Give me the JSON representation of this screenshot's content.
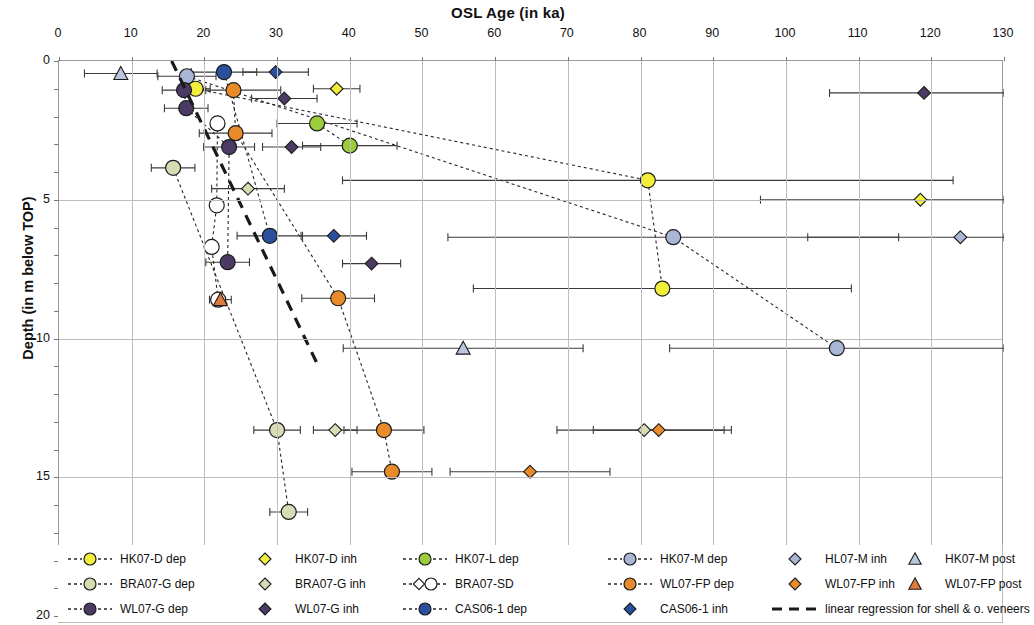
{
  "chart_data": {
    "type": "scatter",
    "title": "OSL Age (in ka)",
    "xlabel": "OSL Age (in ka)",
    "ylabel": "Depth  (in m below TOP)",
    "xlim": [
      0,
      130
    ],
    "ylim": [
      0,
      20
    ],
    "x_axis_position": "top",
    "y_axis_inverted": true,
    "xticks": [
      0,
      10,
      20,
      30,
      40,
      50,
      60,
      70,
      80,
      90,
      100,
      110,
      120,
      130
    ],
    "yticks": [
      0,
      5,
      10,
      15,
      20
    ],
    "y_minor_tick_step": 1,
    "grid": "vertical major + horizontal major",
    "legend_position": "bottom",
    "errorbars": "horizontal (1-sigma) on every point",
    "series": [
      {
        "name": "HK07-D dep",
        "marker": "circle",
        "color": "#f2ee3c",
        "connected": true,
        "points": [
          {
            "age": 18.8,
            "depth": 1.0,
            "err": 2.0
          },
          {
            "age": 81.0,
            "depth": 4.3,
            "err": 42.0
          },
          {
            "age": 83.0,
            "depth": 8.2,
            "err": 26.0
          }
        ]
      },
      {
        "name": "HK07-D inh",
        "marker": "diamond",
        "color": "#f2ee3c",
        "connected": false,
        "points": [
          {
            "age": 38.2,
            "depth": 1.0,
            "err": 3.2
          },
          {
            "age": 118.5,
            "depth": 5.0,
            "err": 22.0
          }
        ]
      },
      {
        "name": "HK07-L dep",
        "marker": "circle",
        "color": "#9ccc3c",
        "connected": true,
        "points": [
          {
            "age": 35.5,
            "depth": 2.25,
            "err": 5.5
          },
          {
            "age": 40.0,
            "depth": 3.05,
            "err": 6.5
          }
        ]
      },
      {
        "name": "HK07-M dep",
        "marker": "circle",
        "color": "#a9b6d6",
        "connected": true,
        "points": [
          {
            "age": 17.6,
            "depth": 0.55,
            "err": 4.0
          },
          {
            "age": 84.5,
            "depth": 6.35,
            "err": 31.0
          },
          {
            "age": 107.0,
            "depth": 10.35,
            "err": 23.0
          }
        ]
      },
      {
        "name": "HL07-M inh",
        "marker": "diamond",
        "color": "#a9b6d6",
        "connected": false,
        "points": [
          {
            "age": 124.0,
            "depth": 6.35,
            "err": 21.0
          }
        ]
      },
      {
        "name": "HK07-M post",
        "marker": "triangle",
        "color": "#b9c6de",
        "connected": false,
        "points": [
          {
            "age": 8.5,
            "depth": 0.45,
            "err": 5.0
          },
          {
            "age": 55.6,
            "depth": 10.35,
            "err": 16.5
          }
        ]
      },
      {
        "name": "BRA07-G dep",
        "marker": "circle",
        "color": "#d9dbb4",
        "connected": true,
        "points": [
          {
            "age": 15.7,
            "depth": 3.85,
            "err": 3.0
          },
          {
            "age": 30.0,
            "depth": 13.3,
            "err": 3.2
          },
          {
            "age": 31.6,
            "depth": 16.25,
            "err": 2.6
          }
        ]
      },
      {
        "name": "BRA07-G inh",
        "marker": "diamond",
        "color": "#d9dbb4",
        "connected": false,
        "points": [
          {
            "age": 26.0,
            "depth": 4.6,
            "err": 5.0
          },
          {
            "age": 38.0,
            "depth": 13.3,
            "err": 3.0
          },
          {
            "age": 80.5,
            "depth": 13.3,
            "err": 12.0
          }
        ]
      },
      {
        "name": "BRA07-SD",
        "marker": "open-circle",
        "color": "#ffffff",
        "connected": true,
        "points": [
          {
            "age": 21.8,
            "depth": 2.25,
            "err": 0
          },
          {
            "age": 21.7,
            "depth": 5.2,
            "err": 0
          },
          {
            "age": 21.0,
            "depth": 6.7,
            "err": 0
          },
          {
            "age": 21.9,
            "depth": 8.6,
            "err": 0
          }
        ]
      },
      {
        "name": "WL07-FP dep",
        "marker": "circle",
        "color": "#e98a2b",
        "connected": true,
        "points": [
          {
            "age": 24.0,
            "depth": 1.05,
            "err": 6.5
          },
          {
            "age": 24.3,
            "depth": 2.6,
            "err": 5.0
          },
          {
            "age": 38.4,
            "depth": 8.55,
            "err": 5.0
          },
          {
            "age": 44.7,
            "depth": 13.3,
            "err": 5.5
          },
          {
            "age": 45.8,
            "depth": 14.8,
            "err": 5.5
          }
        ]
      },
      {
        "name": "WL07-FP inh",
        "marker": "diamond",
        "color": "#e98a2b",
        "connected": false,
        "points": [
          {
            "age": 82.5,
            "depth": 13.3,
            "err": 9.0
          },
          {
            "age": 64.8,
            "depth": 14.8,
            "err": 11.0
          }
        ]
      },
      {
        "name": "WL07-FP post",
        "marker": "triangle",
        "color": "#dd7a3c",
        "connected": false,
        "points": [
          {
            "age": 22.2,
            "depth": 8.6,
            "err": 1.5
          }
        ]
      },
      {
        "name": "WL07-G dep",
        "marker": "circle",
        "color": "#4b3a63",
        "connected": true,
        "points": [
          {
            "age": 17.2,
            "depth": 1.05,
            "err": 3.0
          },
          {
            "age": 17.5,
            "depth": 1.7,
            "err": 3.0
          },
          {
            "age": 23.4,
            "depth": 3.1,
            "err": 3.5
          },
          {
            "age": 23.2,
            "depth": 7.25,
            "err": 3.0
          }
        ]
      },
      {
        "name": "WL07-G inh",
        "marker": "diamond",
        "color": "#4b3a63",
        "connected": false,
        "points": [
          {
            "age": 31.0,
            "depth": 1.35,
            "err": 4.5
          },
          {
            "age": 32.0,
            "depth": 3.1,
            "err": 4.0
          },
          {
            "age": 43.0,
            "depth": 7.3,
            "err": 4.0
          },
          {
            "age": 119.0,
            "depth": 1.15,
            "err": 13.0
          }
        ]
      },
      {
        "name": "CAS06-1 dep",
        "marker": "circle",
        "color": "#2b4f9e",
        "connected": true,
        "points": [
          {
            "age": 22.7,
            "depth": 0.4,
            "err": 4.5
          },
          {
            "age": 29.0,
            "depth": 6.3,
            "err": 4.5
          }
        ]
      },
      {
        "name": "CAS06-1 inh",
        "marker": "diamond",
        "color": "#2b4f9e",
        "connected": false,
        "points": [
          {
            "age": 29.8,
            "depth": 0.4,
            "err": 4.5
          },
          {
            "age": 37.8,
            "depth": 6.3,
            "err": 4.5
          }
        ]
      },
      {
        "name": "linear regression for shell & o. veneers",
        "marker": "dashed-line",
        "color": "#1a1a1a",
        "connected": true,
        "points": [
          {
            "age": 15.5,
            "depth": 0.0
          },
          {
            "age": 35.5,
            "depth": 10.9
          }
        ]
      }
    ]
  },
  "axes": {
    "top_title": "OSL Age (in ka)",
    "y_title": "Depth  (in m below TOP)",
    "xtick_labels": [
      "0",
      "10",
      "20",
      "30",
      "40",
      "50",
      "60",
      "70",
      "80",
      "90",
      "100",
      "110",
      "120",
      "130"
    ],
    "ytick_labels": [
      "0",
      "5",
      "10",
      "15",
      "20"
    ]
  },
  "legend": {
    "items": [
      {
        "label": "HK07-D dep",
        "sym": "circle-dash",
        "color": "#f2ee3c"
      },
      {
        "label": "HK07-D inh",
        "sym": "diamond",
        "color": "#f2ee3c"
      },
      {
        "label": "HK07-L dep",
        "sym": "circle-dash",
        "color": "#9ccc3c"
      },
      {
        "label": "HK07-M dep",
        "sym": "circle-dash",
        "color": "#a9b6d6"
      },
      {
        "label": "HL07-M inh",
        "sym": "diamond",
        "color": "#a9b6d6"
      },
      {
        "label": "HK07-M post",
        "sym": "triangle",
        "color": "#b9c6de"
      },
      {
        "label": "BRA07-G dep",
        "sym": "circle-dash",
        "color": "#d9dbb4"
      },
      {
        "label": "BRA07-G inh",
        "sym": "diamond",
        "color": "#d9dbb4"
      },
      {
        "label": "BRA07-SD",
        "sym": "opencircle-dash",
        "color": "#ffffff"
      },
      {
        "label": "WL07-FP dep",
        "sym": "circle-dash",
        "color": "#e98a2b"
      },
      {
        "label": "WL07-FP inh",
        "sym": "diamond",
        "color": "#e98a2b"
      },
      {
        "label": "WL07-FP post",
        "sym": "triangle",
        "color": "#dd7a3c"
      },
      {
        "label": "WL07-G dep",
        "sym": "circle-dash",
        "color": "#4b3a63"
      },
      {
        "label": "WL07-G inh",
        "sym": "diamond",
        "color": "#4b3a63"
      },
      {
        "label": "CAS06-1 dep",
        "sym": "circle-dash",
        "color": "#2b4f9e"
      },
      {
        "label": "CAS06-1 inh",
        "sym": "diamond",
        "color": "#2b4f9e"
      },
      {
        "label": "linear regression for shell & o. veneers",
        "sym": "longdash",
        "color": "#1a1a1a"
      }
    ]
  }
}
